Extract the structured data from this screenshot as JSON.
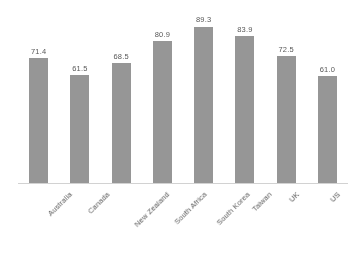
{
  "chart_data": {
    "type": "bar",
    "title": "",
    "subtitle": "",
    "xlabel": "",
    "ylabel": "",
    "categories": [
      "Australia",
      "Canada",
      "New Zealand",
      "South Africa",
      "South Korea",
      "Taiwan",
      "UK",
      "US"
    ],
    "values": [
      71.4,
      61.5,
      68.5,
      80.9,
      89.3,
      83.9,
      72.5,
      61.0
    ],
    "data_labels": [
      "71.4",
      "61.5",
      "68.5",
      "80.9",
      "89.3",
      "83.9",
      "72.5",
      "61.0"
    ],
    "ylim": [
      0,
      100
    ],
    "grid": false,
    "legend": false,
    "legend_position": "none",
    "y_axis_visible": false,
    "x_axis_visible": true,
    "label_rotation_deg": -45,
    "bar_color": "#969696",
    "axis_color": "#d2d2d2",
    "text_color": "#585858",
    "background_color": "#ffffff"
  }
}
